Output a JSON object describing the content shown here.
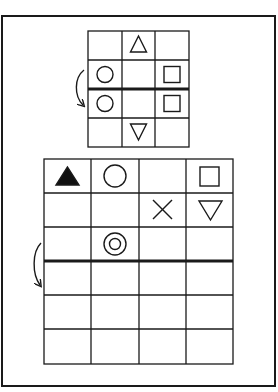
{
  "puzzle": {
    "description": "Grid fold/reflection puzzle: symbols above the thick line are mirrored below it",
    "colors": {
      "line": "#1a1a1a",
      "background": "#ffffff",
      "fill": "#111111"
    },
    "example_grid": {
      "rows": 4,
      "cols": 3,
      "fold_after_row": 2,
      "cells": [
        [
          "",
          "triangle-up",
          ""
        ],
        [
          "circle",
          "",
          "square"
        ],
        [
          "circle",
          "",
          "square"
        ],
        [
          "",
          "triangle-down",
          ""
        ]
      ]
    },
    "question_grid": {
      "rows": 6,
      "cols": 4,
      "fold_after_row": 3,
      "cells": [
        [
          "triangle-up-filled",
          "circle",
          "",
          "square"
        ],
        [
          "",
          "",
          "cross",
          "triangle-down"
        ],
        [
          "",
          "double-circle",
          "",
          ""
        ],
        [
          "",
          "",
          "",
          ""
        ],
        [
          "",
          "",
          "",
          ""
        ],
        [
          "",
          "",
          "",
          ""
        ]
      ]
    },
    "icons": {
      "fold_arrow": "curved-arrow-down-icon"
    }
  }
}
